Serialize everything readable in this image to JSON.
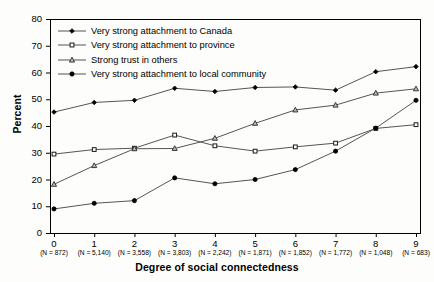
{
  "chart_data": {
    "type": "line",
    "title": "",
    "xlabel": "Degree of social connectedness",
    "ylabel": "Percent",
    "xlim": [
      0,
      9
    ],
    "ylim": [
      0,
      80
    ],
    "ytick_step": 10,
    "grid": false,
    "legend_position": "top-left",
    "categories": [
      "0",
      "1",
      "2",
      "3",
      "4",
      "5",
      "6",
      "7",
      "8",
      "9"
    ],
    "sample_sizes": [
      "(N = 872)",
      "(N = 5,140)",
      "(N = 3,558)",
      "(N = 3,803)",
      "(N = 2,242)",
      "(N = 1,871)",
      "(N = 1,852)",
      "(N = 1,772)",
      "(N = 1,048)",
      "(N = 683)"
    ],
    "yticks": [
      "0",
      "10",
      "20",
      "30",
      "40",
      "50",
      "60",
      "70",
      "80"
    ],
    "series": [
      {
        "name": "Very strong attachment to Canada",
        "marker": "filled-diamond",
        "values": [
          45.2,
          48.8,
          49.6,
          54.1,
          52.9,
          54.4,
          54.6,
          53.4,
          60.3,
          62.2
        ]
      },
      {
        "name": "Very strong attachment to province",
        "marker": "open-square",
        "values": [
          29.5,
          31.2,
          31.7,
          36.6,
          32.6,
          30.6,
          32.2,
          33.6,
          39.1,
          40.5
        ]
      },
      {
        "name": "Strong trust in others",
        "marker": "open-triangle",
        "values": [
          18.2,
          25.2,
          31.5,
          31.6,
          35.4,
          41.0,
          46.0,
          47.8,
          52.3,
          53.9
        ]
      },
      {
        "name": "Very strong attachment to local community",
        "marker": "filled-circle",
        "values": [
          9.0,
          11.1,
          12.1,
          20.6,
          18.4,
          20.0,
          23.7,
          30.6,
          39.2,
          49.6
        ]
      }
    ]
  },
  "colors": {
    "line": "#555555",
    "marker_fill": "#000000",
    "marker_open": "#ffffff",
    "triangle_fill": "#8c8c8c",
    "axis": "#000000",
    "background": "#fdfdfb"
  }
}
